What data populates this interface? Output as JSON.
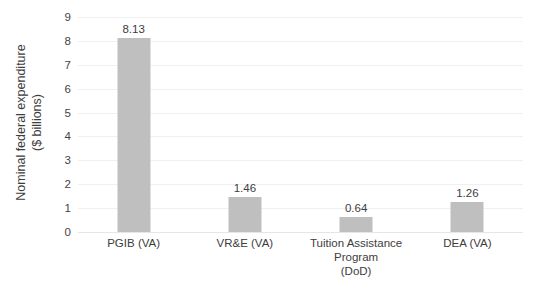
{
  "chart_data": {
    "type": "bar",
    "title": "",
    "xlabel": "",
    "ylabel_line1": "Nominal federal expenditure",
    "ylabel_line2": "($ billions)",
    "categories": [
      "PGIB (VA)",
      "VR&E (VA)",
      "Tuition Assistance Program (DoD)",
      "DEA (VA)"
    ],
    "category_lines": [
      [
        "PGIB (VA)"
      ],
      [
        "VR&E (VA)"
      ],
      [
        "Tuition Assistance Program",
        "(DoD)"
      ],
      [
        "DEA (VA)"
      ]
    ],
    "values": [
      8.13,
      1.46,
      0.64,
      1.26
    ],
    "value_labels": [
      "8.13",
      "1.46",
      "0.64",
      "1.26"
    ],
    "ylim": [
      0,
      9
    ],
    "ytick_step": 1,
    "ytick_labels": [
      "9",
      "8",
      "7",
      "6",
      "5",
      "4",
      "3",
      "2",
      "1",
      "0"
    ],
    "grid": true,
    "legend": false,
    "colors": {
      "bar": "#BFBFBF",
      "gridline": "#F0F0F0",
      "text": "#3D3D3D",
      "background": "#FFFFFF"
    }
  }
}
